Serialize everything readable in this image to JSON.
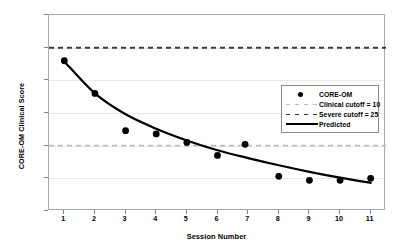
{
  "chart_data": {
    "type": "scatter",
    "title": "",
    "xlabel": "Session Number",
    "ylabel": "CORE-OM Clinical Score",
    "xlim": [
      0.5,
      11.5
    ],
    "ylim": [
      0.0,
      30.0
    ],
    "grid": true,
    "legend_position": "upper right",
    "x_tick_labels": [
      "1",
      "2",
      "3",
      "4",
      "5",
      "6",
      "7",
      "8",
      "9",
      "10",
      "11"
    ],
    "x_tick_values": [
      1,
      2,
      3,
      4,
      5,
      6,
      7,
      8,
      9,
      10,
      11
    ],
    "y_tick_labels": [
      "0.0",
      "5.0",
      "10.0",
      "15.0",
      "20.0",
      "25.0",
      "30.0"
    ],
    "y_tick_values": [
      0,
      5,
      10,
      15,
      20,
      25,
      30
    ],
    "series": [
      {
        "name": "CORE-OM",
        "type": "scatter",
        "marker": "filled-circle",
        "color": "#000000",
        "x": [
          1.0,
          2.0,
          3.0,
          4.0,
          5.0,
          6.0,
          6.9,
          8.0,
          9.0,
          10.0,
          11.0
        ],
        "values": [
          23.0,
          18.0,
          12.3,
          11.8,
          10.5,
          8.5,
          10.2,
          5.3,
          4.7,
          4.7,
          5.0
        ]
      },
      {
        "name": "Predicted",
        "type": "line",
        "style": "solid",
        "color": "#000000",
        "x": [
          1.0,
          2.0,
          3.0,
          4.0,
          5.0,
          6.0,
          7.0,
          8.0,
          9.0,
          10.0,
          11.0
        ],
        "values": [
          22.9,
          18.0,
          14.8,
          12.6,
          10.8,
          9.3,
          8.1,
          7.0,
          6.0,
          5.1,
          4.3
        ]
      },
      {
        "name": "Clinical cutoff = 10",
        "type": "hline",
        "style": "dashed",
        "color": "#bdbdbd",
        "value": 10
      },
      {
        "name": "Severe cutoff = 25",
        "type": "hline",
        "style": "dashed",
        "color": "#3a3a3a",
        "value": 25
      }
    ],
    "legend_entries": [
      {
        "label": "CORE-OM",
        "key": "dot"
      },
      {
        "label": "Clinical cutoff = 10",
        "key": "dash-light"
      },
      {
        "label": "Severe cutoff = 25",
        "key": "dash-dark"
      },
      {
        "label": "Predicted",
        "key": "solid"
      }
    ]
  }
}
